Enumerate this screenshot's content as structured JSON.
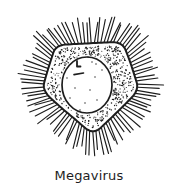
{
  "figure": {
    "caption": "Megavirus",
    "ink_color": "#1d1d1d",
    "background_color": "#ffffff"
  },
  "illustration": {
    "name": "megavirus-line-drawing",
    "canvas": {
      "width": 178,
      "height": 196
    },
    "center": {
      "x": 91,
      "y": 86
    },
    "capsid": {
      "vertices": [
        [
          56,
          45
        ],
        [
          122,
          42
        ],
        [
          140,
          90
        ],
        [
          93,
          135
        ],
        [
          42,
          90
        ]
      ],
      "edge_wobble": 1.2,
      "smoothing_iterations": 3,
      "stroke_width": 2
    },
    "fibers": {
      "spacing": 3.2,
      "min_length": 18,
      "max_length": 28,
      "stroke_width": 1.15,
      "angle_jitter": 0.09
    },
    "stipple": {
      "count": 500,
      "min_radius": 0.45,
      "max_radius": 0.8,
      "edge_margin": 3.5,
      "core_margin": 2
    },
    "core": {
      "cx": 87,
      "cy": 85,
      "rx": 25,
      "ry": 28,
      "stroke_width": 1.7
    },
    "granule_radius": 0.7,
    "core_granules": [
      [
        66,
        64
      ],
      [
        88,
        57
      ],
      [
        96,
        64
      ],
      [
        102,
        70
      ],
      [
        67,
        78
      ],
      [
        95,
        77
      ],
      [
        75,
        88
      ],
      [
        90,
        90
      ],
      [
        70,
        98
      ],
      [
        85,
        103
      ],
      [
        97,
        100
      ],
      [
        80,
        110
      ],
      [
        92,
        62
      ]
    ],
    "core_marks": [
      {
        "d": "M77 61 L77 66.5 L80.5 66.5",
        "width": 1.8
      },
      {
        "d": "M74 74.6 L83.5 73",
        "width": 1.6
      }
    ],
    "seed": 11
  }
}
